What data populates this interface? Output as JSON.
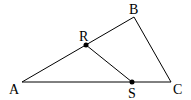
{
  "diagram": {
    "type": "geometry-triangle",
    "points": {
      "A": {
        "label": "A",
        "x": 22,
        "y": 82
      },
      "B": {
        "label": "B",
        "x": 134,
        "y": 17
      },
      "C": {
        "label": "C",
        "x": 171,
        "y": 82
      },
      "R": {
        "label": "R",
        "x": 86,
        "y": 45
      },
      "S": {
        "label": "S",
        "x": 132,
        "y": 82
      }
    },
    "segments": [
      [
        "A",
        "B"
      ],
      [
        "B",
        "C"
      ],
      [
        "A",
        "C"
      ],
      [
        "R",
        "S"
      ]
    ],
    "marked_points": [
      "R",
      "S"
    ],
    "colors": {
      "stroke": "#000000",
      "background": "#ffffff"
    }
  }
}
